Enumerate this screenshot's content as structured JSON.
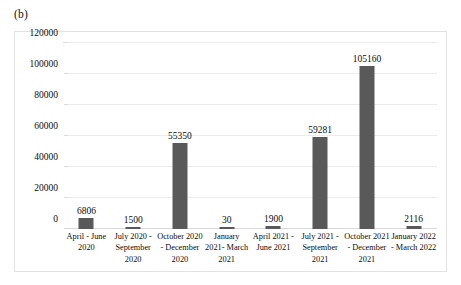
{
  "panel": {
    "label": "(b)"
  },
  "colors": {
    "bar_fill": "#595959",
    "gridline": "#eceaea",
    "frame_border": "#e2e2e2",
    "text": "#0c0c0c"
  },
  "chart_data": {
    "type": "bar",
    "title": "",
    "subtitle": "",
    "xlabel": "",
    "ylabel": "",
    "ylim": [
      0,
      120000
    ],
    "ytick_labels": [
      "0",
      "20000",
      "40000",
      "60000",
      "80000",
      "100000",
      "120000"
    ],
    "ytick_values": [
      0,
      20000,
      40000,
      60000,
      80000,
      100000,
      120000
    ],
    "grid": true,
    "legend": "none",
    "categories": [
      "April - June 2020",
      "July 2020 - September 2020",
      "October 2020 - December 2020",
      "January 2021- March 2021",
      "April 2021 - June 2021",
      "July 2021 - September 2021",
      "October 2021 - December 2021",
      "January 2022 - March 2022"
    ],
    "values": [
      6806,
      1500,
      55350,
      30,
      1900,
      59281,
      105160,
      2116
    ],
    "data_labels": [
      "6806",
      "1500",
      "55350",
      "30",
      "1900",
      "59281",
      "105160",
      "2116"
    ]
  }
}
